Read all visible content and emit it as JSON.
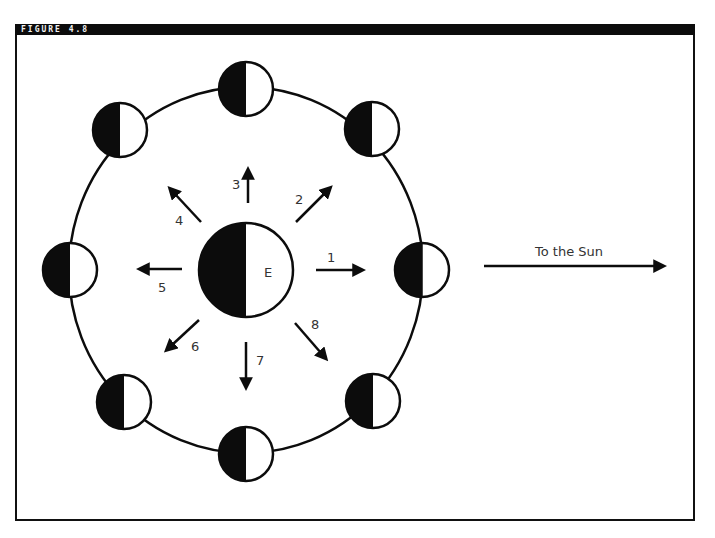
{
  "figure": {
    "label": "FIGURE 4.8"
  },
  "diagram": {
    "earth_label": "E",
    "sun_label": "To the Sun",
    "colors": {
      "ink": "#0c0c0c",
      "paper": "#ffffff",
      "header": "#0c0c0c",
      "text": "#333333"
    },
    "moon_positions": [
      {
        "number": "1",
        "position": "right",
        "direction": "toward Sun"
      },
      {
        "number": "2",
        "position": "upper-right"
      },
      {
        "number": "3",
        "position": "top"
      },
      {
        "number": "4",
        "position": "upper-left"
      },
      {
        "number": "5",
        "position": "left"
      },
      {
        "number": "6",
        "position": "lower-left"
      },
      {
        "number": "7",
        "position": "bottom"
      },
      {
        "number": "8",
        "position": "lower-right"
      }
    ],
    "arrow_labels": [
      "1",
      "2",
      "3",
      "4",
      "5",
      "6",
      "7",
      "8"
    ]
  }
}
